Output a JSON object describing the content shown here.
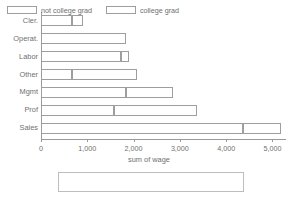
{
  "chart_data": {
    "type": "bar",
    "orientation": "horizontal",
    "stacked": true,
    "title": "",
    "xlabel": "sum of wage",
    "ylabel": "",
    "xlim": [
      0,
      5400
    ],
    "grid": false,
    "legend_position": "bottom",
    "categories": [
      "Cler.",
      "Operat.",
      "Labor",
      "Other",
      "Mgmt",
      "Prof",
      "Sales"
    ],
    "series": [
      {
        "name": "not college grad",
        "values": [
          680,
          1830,
          1720,
          680,
          1830,
          1570,
          4370
        ]
      },
      {
        "name": "college grad",
        "values": [
          220,
          0,
          180,
          1390,
          1030,
          1790,
          810
        ]
      }
    ],
    "totals": [
      900,
      1830,
      1900,
      2070,
      2860,
      3360,
      5180
    ],
    "xticks": [
      0,
      1000,
      2000,
      3000,
      4000,
      5000
    ],
    "xtick_labels": [
      "0",
      "1,000",
      "2,000",
      "3,000",
      "4,000",
      "5,000"
    ]
  },
  "legend": {
    "items": [
      {
        "label": "not college grad"
      },
      {
        "label": "college grad"
      }
    ]
  },
  "colors": {
    "bar_fill": "#ffffff",
    "bar_stroke": "#9e9e9e",
    "axis": "#9a9a9a",
    "text": "#6f6f6f",
    "background": "#ffffff"
  }
}
